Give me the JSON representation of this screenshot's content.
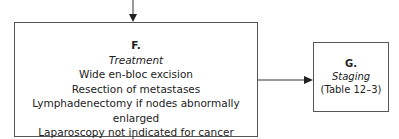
{
  "nodes": {
    "F": {
      "label": "F.",
      "title": "Treatment",
      "lines": [
        "Wide en-bloc excision",
        "Resection of metastases",
        "Lymphadenectomy if nodes abnormally enlarged",
        "Laparoscopy not indicated for cancer"
      ]
    },
    "G": {
      "label": "G.",
      "title": "Staging",
      "lines": [
        "(Table 12–3)"
      ]
    }
  },
  "edges": [
    {
      "from": "above",
      "to": "F"
    },
    {
      "from": "F",
      "to": "G"
    },
    {
      "from": "F",
      "to": "below"
    }
  ]
}
